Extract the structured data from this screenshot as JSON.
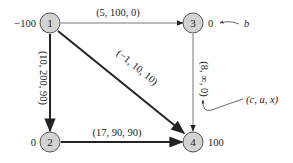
{
  "nodes": [
    {
      "id": "1",
      "supply": "−100"
    },
    {
      "id": "2",
      "supply": "0"
    },
    {
      "id": "3",
      "supply": "0"
    },
    {
      "id": "4",
      "supply": "100"
    }
  ],
  "edges": [
    {
      "from": "1",
      "to": "3",
      "label": "(5, 100, 0)"
    },
    {
      "from": "1",
      "to": "2",
      "label": "(10, 200, 90)"
    },
    {
      "from": "1",
      "to": "4",
      "label": "(−1, 10, 10)"
    },
    {
      "from": "3",
      "to": "4",
      "label": "(8, ∞, 0)"
    },
    {
      "from": "2",
      "to": "4",
      "label": "(17, 90, 90)"
    }
  ],
  "annotations": {
    "b": "b",
    "cux": "(c, u, x)"
  }
}
